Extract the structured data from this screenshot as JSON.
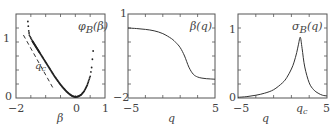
{
  "chart_data": [
    {
      "type": "scatter",
      "title": "φB(β)",
      "label": "φB(β)",
      "xlabel": "β",
      "ylabel": "",
      "xlim": [
        -2,
        1
      ],
      "ylim": [
        0,
        1.3
      ],
      "xticks": [
        "-2",
        "0",
        "1"
      ],
      "yticks": [
        "0",
        "1"
      ],
      "annotation": "qc",
      "series": [
        {
          "name": "φB(β) points",
          "x": [
            -1.6,
            -1.57,
            -1.55,
            -1.5,
            -1.45,
            -1.4,
            -1.35,
            -1.3,
            -1.25,
            -1.2,
            -1.1,
            -1.0,
            -0.9,
            -0.8,
            -0.7,
            -0.6,
            -0.5,
            -0.4,
            -0.3,
            -0.2,
            -0.1,
            0.0,
            0.1,
            0.2,
            0.3,
            0.4,
            0.5,
            0.55,
            0.6
          ],
          "y": [
            1.28,
            1.12,
            1.05,
            1.0,
            0.95,
            0.91,
            0.87,
            0.83,
            0.79,
            0.75,
            0.67,
            0.59,
            0.51,
            0.43,
            0.35,
            0.28,
            0.21,
            0.15,
            0.095,
            0.05,
            0.015,
            0.0,
            0.01,
            0.04,
            0.1,
            0.2,
            0.35,
            0.5,
            0.78
          ]
        },
        {
          "name": "asymptote qc (dashed)",
          "x": [
            -1.75,
            -0.75
          ],
          "y": [
            1.05,
            0.15
          ]
        }
      ]
    },
    {
      "type": "line",
      "title": "β(q)",
      "label": "β(q)",
      "xlabel": "q",
      "ylabel": "",
      "xlim": [
        -5,
        5
      ],
      "ylim": [
        -2,
        1
      ],
      "xticks": [
        "-5",
        "5"
      ],
      "yticks": [
        "-2",
        "1"
      ],
      "series": [
        {
          "name": "β(q)",
          "x": [
            -5,
            -4,
            -3,
            -2,
            -1,
            0,
            0.5,
            1,
            1.5,
            2,
            2.5,
            3,
            3.5,
            4,
            4.5,
            5
          ],
          "y": [
            0.5,
            0.48,
            0.45,
            0.4,
            0.3,
            0.12,
            -0.02,
            -0.2,
            -0.5,
            -0.9,
            -1.15,
            -1.25,
            -1.29,
            -1.31,
            -1.32,
            -1.33
          ]
        }
      ]
    },
    {
      "type": "line",
      "title": "σB(q)",
      "label": "σB(q)",
      "xlabel": "q",
      "ylabel": "",
      "xlim": [
        -5,
        5
      ],
      "ylim": [
        0,
        1.2
      ],
      "xticks": [
        "-5",
        "qc",
        "5"
      ],
      "yticks": [
        "0",
        "1"
      ],
      "series": [
        {
          "name": "σB(q)",
          "x": [
            -5,
            -4,
            -3,
            -2,
            -1,
            0,
            0.5,
            1,
            1.3,
            1.6,
            1.8,
            2.0,
            2.2,
            2.5,
            3,
            3.5,
            4,
            4.5,
            5
          ],
          "y": [
            0.01,
            0.02,
            0.04,
            0.07,
            0.12,
            0.22,
            0.3,
            0.42,
            0.52,
            0.66,
            0.78,
            0.88,
            0.72,
            0.45,
            0.22,
            0.12,
            0.07,
            0.04,
            0.03
          ]
        }
      ]
    }
  ],
  "panels": [
    {
      "label_main": "φ",
      "label_sub": "B",
      "label_arg": "(β)",
      "xlabel": "β",
      "annotation_main": "q",
      "annotation_sub": "c",
      "xticks": [
        "−2",
        "0",
        "1"
      ],
      "yticks": [
        "0",
        "1"
      ]
    },
    {
      "label_main": "β(q)",
      "xlabel": "q",
      "xticks": [
        "−5",
        "5"
      ],
      "yticks": [
        "−2",
        "1"
      ]
    },
    {
      "label_main": "σ",
      "label_sub": "B",
      "label_arg": "(q)",
      "xlabel": "q",
      "xticks": [
        "−5",
        "5"
      ],
      "qc_main": "q",
      "qc_sub": "c",
      "yticks": [
        "0",
        "1"
      ]
    }
  ]
}
